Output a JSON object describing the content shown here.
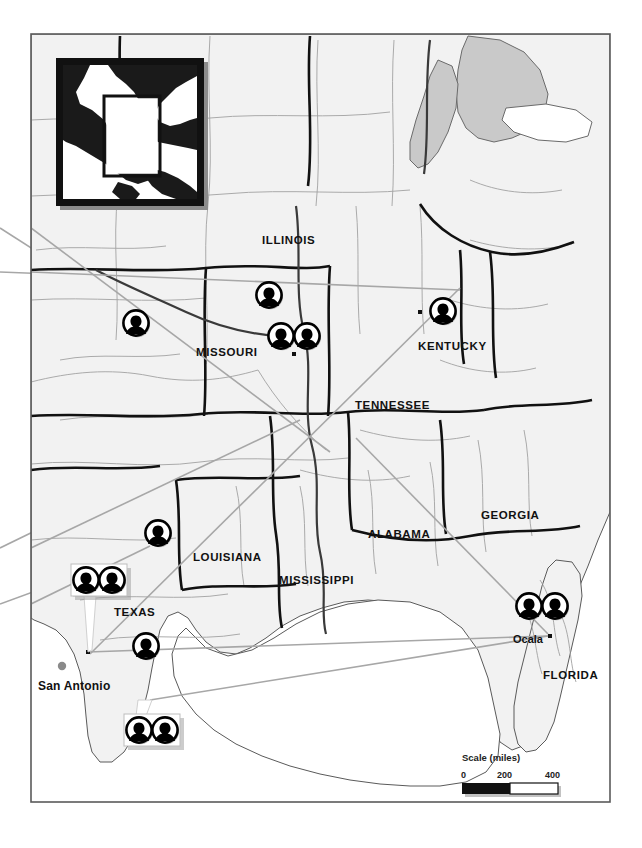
{
  "map": {
    "title_inset": "north-america-locator-inset",
    "frame": {
      "x": 31,
      "y": 34,
      "width": 579,
      "height": 768
    },
    "background_color": "#ffffff",
    "land_color": "#f2f2f2",
    "water_color": "#ffffff",
    "lake_color": "#c9c9c9",
    "boundary_color": "#111111",
    "thin_line_color": "#9a9a9a",
    "leader_line_color": "#a0a0a0",
    "state_labels": [
      {
        "name": "ILLINOIS",
        "text": "ILLINOIS",
        "x": 262,
        "y": 244
      },
      {
        "name": "MISSOURI",
        "text": "MISSOURI",
        "x": 196,
        "y": 356
      },
      {
        "name": "KENTUCKY",
        "text": "KENTUCKY",
        "x": 418,
        "y": 350
      },
      {
        "name": "TENNESSEE",
        "text": "TENNESSEE",
        "x": 355,
        "y": 409
      },
      {
        "name": "LOUISIANA",
        "text": "LOUISIANA",
        "x": 193,
        "y": 561
      },
      {
        "name": "MISSISSIPPI",
        "text": "MISSISSIPPI",
        "x": 279,
        "y": 584
      },
      {
        "name": "ALABAMA",
        "text": "ALABAMA",
        "x": 368,
        "y": 538
      },
      {
        "name": "GEORGIA",
        "text": "GEORGIA",
        "x": 481,
        "y": 519
      },
      {
        "name": "FLORIDA",
        "text": "FLORIDA",
        "x": 543,
        "y": 679
      },
      {
        "name": "TEXAS",
        "text": "TEXAS",
        "x": 114,
        "y": 616
      }
    ],
    "city_labels": [
      {
        "name": "san-antonio",
        "text": "San Antonio",
        "x": 38,
        "y": 690,
        "dot": {
          "x": 62,
          "y": 666
        }
      },
      {
        "name": "ocala",
        "text": "Ocala",
        "x": 513,
        "y": 643,
        "dot": {
          "x": 551,
          "y": 638
        }
      }
    ],
    "markers": [
      {
        "name": "marker-missouri-west",
        "type": "single",
        "x": 136,
        "y": 323
      },
      {
        "name": "marker-illinois-central",
        "type": "single",
        "x": 269,
        "y": 295
      },
      {
        "name": "marker-stlouis-a",
        "type": "single",
        "x": 281,
        "y": 336
      },
      {
        "name": "marker-stlouis-b",
        "type": "single",
        "x": 307,
        "y": 336
      },
      {
        "name": "marker-kentucky",
        "type": "single",
        "x": 443,
        "y": 311
      },
      {
        "name": "marker-east-texas",
        "type": "single",
        "x": 158,
        "y": 533
      },
      {
        "name": "marker-gulf-coast-texas",
        "type": "single",
        "x": 146,
        "y": 646
      },
      {
        "name": "marker-pair-central-texas",
        "type": "pair",
        "x": 73,
        "y": 566,
        "width": 54,
        "height": 32,
        "anchor": {
          "x": 88,
          "y": 652
        }
      },
      {
        "name": "marker-pair-gulf-of-mexico",
        "type": "pair",
        "x": 124,
        "y": 714,
        "width": 54,
        "height": 32,
        "anchor": {
          "x": 152,
          "y": 700
        }
      },
      {
        "name": "marker-pair-ocala-florida",
        "type": "pair-open",
        "x": 516,
        "y": 592,
        "anchor": {
          "x": 551,
          "y": 638
        }
      }
    ],
    "icon_name": "person-bust-icon",
    "scale": {
      "title": "Scale (miles)",
      "ticks": [
        "0",
        "200",
        "400"
      ],
      "bar": {
        "x": 462,
        "y": 782,
        "width": 96,
        "height": 11
      }
    }
  }
}
